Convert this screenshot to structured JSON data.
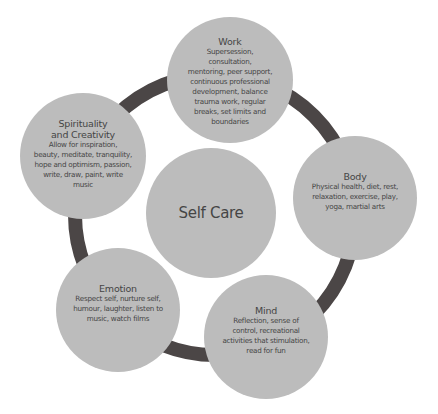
{
  "diagram": {
    "colors": {
      "ring": "#4b4646",
      "circle_fill": "#bcbcbc",
      "text": "#454545",
      "background": "#ffffff"
    },
    "center": {
      "title": "Self Care"
    },
    "nodes": [
      {
        "id": "work",
        "title": "Work",
        "description": "Supersession, consultation, mentoring, peer support, continuous professional development, balance trauma work, regular breaks, set limits and boundaries",
        "lines": [
          "Supersession,",
          "consultation,",
          "mentoring, peer support,",
          "continuous professional",
          "development, balance",
          "trauma work, regular",
          "breaks, set limits and",
          "boundaries"
        ]
      },
      {
        "id": "body",
        "title": "Body",
        "description": "Physical health, diet, rest, relaxation, exercise, play, yoga, martial arts",
        "lines": [
          "Physical health, diet, rest,",
          "relaxation, exercise, play,",
          "yoga, martial arts"
        ]
      },
      {
        "id": "mind",
        "title": "Mind",
        "description": "Reflection, sense of control, recreational activities that stimulation, read for fun",
        "lines": [
          "Reflection, sense of",
          "control, recreational",
          "activities that stimulation,",
          "read for fun"
        ]
      },
      {
        "id": "emotion",
        "title": "Emotion",
        "description": "Respect self, nurture self, humour, laughter, listen to music, watch films",
        "lines": [
          "Respect self, nurture self,",
          "humour, laughter, listen to",
          "music, watch films"
        ]
      },
      {
        "id": "spirituality",
        "title": "Spirituality and Creativity",
        "title_lines": [
          "Spirituality",
          "and Creativity"
        ],
        "description": "Allow for inspiration, beauty, meditate, tranquility, hope and optimism, passion, write, draw, paint, write music",
        "lines": [
          "Allow for inspiration,",
          "beauty, meditate, tranquility,",
          "hope and optimism, passion,",
          "write, draw, paint, write",
          "music"
        ]
      }
    ]
  }
}
